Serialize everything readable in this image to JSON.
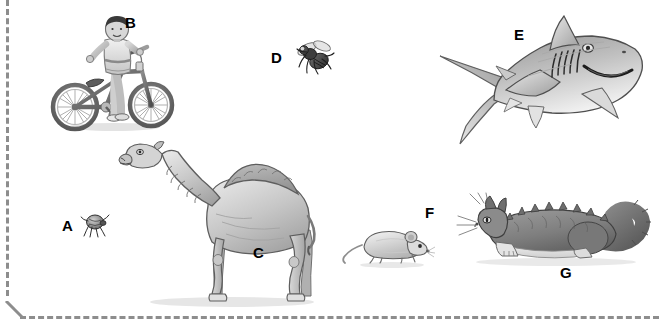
{
  "figure": {
    "background_color": "#ffffff",
    "width": 659,
    "height": 327,
    "border": {
      "style": "dashed",
      "color": "#8d8d8d",
      "edges": [
        "left",
        "bottom"
      ],
      "thickness_px": 3
    },
    "illustration_style": "grayscale pencil drawing"
  },
  "labels": {
    "a": "A",
    "b": "B",
    "c": "C",
    "d": "D",
    "e": "E",
    "f": "F",
    "g": "G"
  },
  "items": [
    {
      "label": "A",
      "subject": "tick",
      "icon": "tick-icon",
      "x": 62,
      "y": 218,
      "size": "very small"
    },
    {
      "label": "B",
      "subject": "boy on bicycle",
      "icon": "boy-on-bicycle-icon",
      "x": 125,
      "y": 15,
      "size": "large"
    },
    {
      "label": "C",
      "subject": "camel",
      "icon": "camel-icon",
      "x": 253,
      "y": 245,
      "size": "large"
    },
    {
      "label": "D",
      "subject": "fly",
      "icon": "fly-icon",
      "x": 271,
      "y": 50,
      "size": "very small"
    },
    {
      "label": "E",
      "subject": "shark",
      "icon": "shark-icon",
      "x": 514,
      "y": 27,
      "size": "large"
    },
    {
      "label": "F",
      "subject": "mouse",
      "icon": "mouse-icon",
      "x": 425,
      "y": 205,
      "size": "small"
    },
    {
      "label": "G",
      "subject": "cat",
      "icon": "cat-icon",
      "x": 560,
      "y": 265,
      "size": "medium"
    }
  ],
  "colors": {
    "ink": "#000000",
    "cut_line": "#8d8d8d",
    "pencil_dark": "#4a4a4a",
    "pencil_mid": "#8a8a8a",
    "pencil_light": "#c9c9c9",
    "paper": "#ffffff"
  }
}
